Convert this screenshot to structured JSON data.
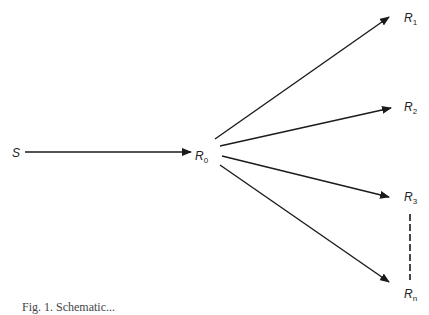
{
  "diagram": {
    "type": "branching-flow",
    "source": {
      "label": "S",
      "x": 12,
      "y": 157
    },
    "hub": {
      "label": "R",
      "sub": "0",
      "x": 195,
      "y": 160
    },
    "targets": [
      {
        "label": "R",
        "sub": "1",
        "x": 404,
        "y": 22,
        "tip": [
          389,
          17
        ]
      },
      {
        "label": "R",
        "sub": "2",
        "x": 404,
        "y": 111,
        "tip": [
          391,
          108
        ]
      },
      {
        "label": "R",
        "sub": "3",
        "x": 404,
        "y": 201,
        "tip": [
          389,
          197
        ]
      },
      {
        "label": "R",
        "sub": "n",
        "x": 404,
        "y": 298,
        "tip": [
          389,
          282
        ]
      }
    ],
    "ellipsis": "dashed vertical line between R3 and Rn",
    "line_color": "#1a1a1a",
    "caption": "Fig. 1. Schematic..."
  }
}
